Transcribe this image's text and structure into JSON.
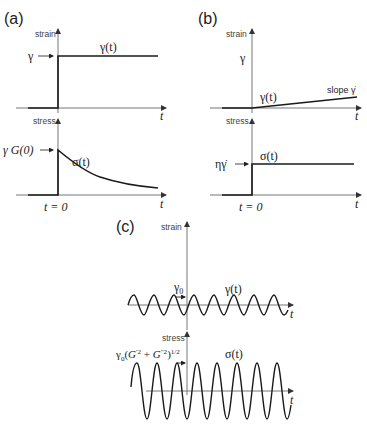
{
  "figure": {
    "panels": {
      "a": {
        "label": "(a)",
        "strain_axis_label": "strain",
        "stress_axis_label": "stress",
        "strain_level_label": "γ",
        "strain_curve_label": "γ(t)",
        "stress_level_label": "γ G(0)",
        "stress_curve_label": "σ(t)",
        "time_label": "t",
        "time_zero_label": "t = 0"
      },
      "b": {
        "label": "(b)",
        "strain_axis_label": "strain",
        "stress_axis_label": "stress",
        "strain_level_label": "γ",
        "strain_curve_label": "γ(t)",
        "slope_label": "slope γ̇",
        "stress_level_label": "ηγ̇",
        "stress_curve_label": "σ(t)",
        "time_label": "t",
        "time_zero_label": "t = 0"
      },
      "c": {
        "label": "(c)",
        "strain_axis_label": "strain",
        "stress_axis_label": "stress",
        "strain_amplitude_label": "γ0",
        "strain_curve_label": "γ(t)",
        "stress_amplitude_label": "γ0(G′2 + G″2)1/2",
        "stress_curve_label": "σ(t)",
        "time_label": "t"
      }
    }
  }
}
